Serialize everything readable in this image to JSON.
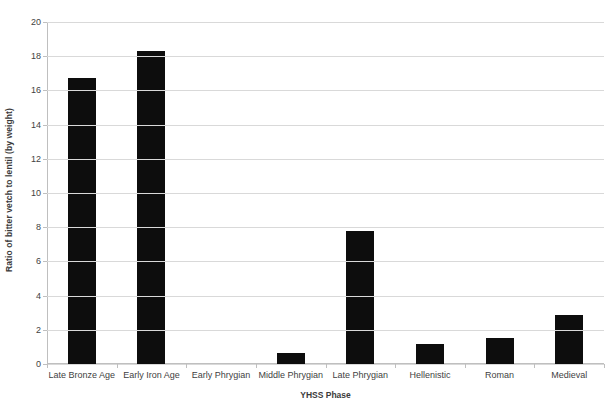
{
  "chart_data": {
    "type": "bar",
    "title": "",
    "xlabel": "YHSS Phase",
    "ylabel": "Ratio of bitter vetch to lentil (by weight)",
    "categories": [
      "Late Bronze Age",
      "Early Iron Age",
      "Early Phrygian",
      "Middle Phrygian",
      "Late Phrygian",
      "Hellenistic",
      "Roman",
      "Medieval"
    ],
    "values": [
      16.7,
      18.3,
      0,
      0.65,
      7.75,
      1.15,
      1.5,
      2.85
    ],
    "ylim": [
      0,
      20
    ],
    "ytick_step": 2,
    "yticks": [
      "0",
      "2",
      "4",
      "6",
      "8",
      "10",
      "12",
      "14",
      "16",
      "18",
      "20"
    ],
    "grid": true,
    "legend": "none",
    "bar_color": "#0d0d0d",
    "gridline_color": "#d9d9d9",
    "axis_color": "#bfbfbf",
    "background": "#ffffff"
  }
}
